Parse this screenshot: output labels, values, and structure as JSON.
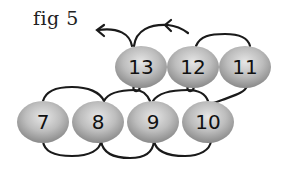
{
  "figure": {
    "label": "fig 5"
  },
  "beads": {
    "top_row": [
      {
        "number": "13",
        "cx": 141,
        "cy": 67
      },
      {
        "number": "12",
        "cx": 193,
        "cy": 67
      },
      {
        "number": "11",
        "cx": 245,
        "cy": 67
      }
    ],
    "bottom_row": [
      {
        "number": "7",
        "cx": 43,
        "cy": 122
      },
      {
        "number": "8",
        "cx": 98,
        "cy": 122
      },
      {
        "number": "9",
        "cx": 153,
        "cy": 122
      },
      {
        "number": "10",
        "cx": 208,
        "cy": 122
      }
    ]
  },
  "colors": {
    "bead_light": "#e4e4e4",
    "bead_dark": "#8e8e8e",
    "thread": "#1a1a1a",
    "text": "#111111"
  }
}
